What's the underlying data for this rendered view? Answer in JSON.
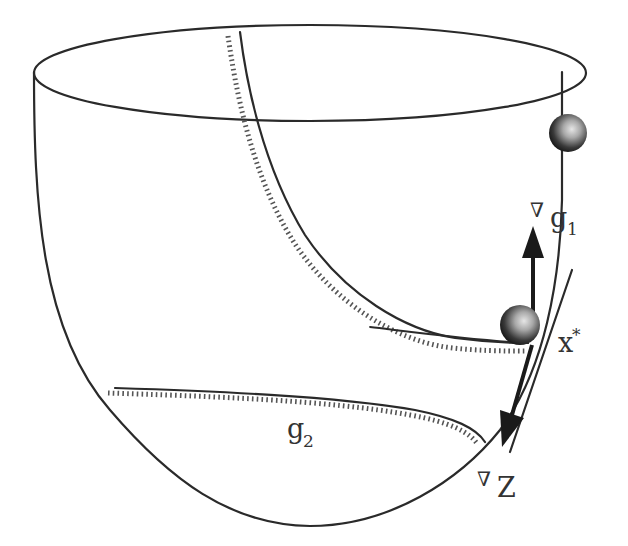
{
  "figure": {
    "colors": {
      "line": "#2a2a2a",
      "hatch": "#555555",
      "ball_dark": "#1e1e1e",
      "ball_light": "#d8d8d8",
      "background": "#ffffff"
    }
  },
  "labels": {
    "grad_g1": {
      "nabla": "∇",
      "base": "g",
      "sub": "1"
    },
    "x_star": {
      "base": "x",
      "sup": "*"
    },
    "grad_z": {
      "nabla": "∇",
      "base": "Z"
    },
    "g2": {
      "base": "g",
      "sub": "2"
    }
  },
  "elements": {
    "bowl": "paraboloid-surface",
    "constraint_g1": "hatched-curve-g1",
    "constraint_g2": "hatched-curve-g2",
    "tangent_line": "tangent-at-x-star",
    "ball_start": "ball-initial-position",
    "ball_optimum": "ball-at-optimum",
    "arrow_up": "gradient-g1-arrow",
    "arrow_down": "gradient-z-arrow"
  }
}
